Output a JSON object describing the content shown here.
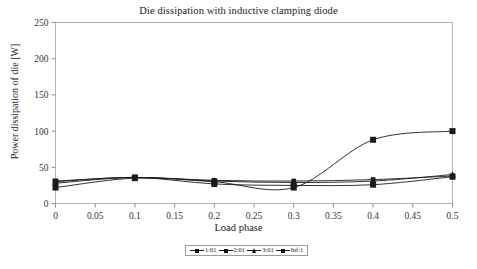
{
  "chart_data": {
    "type": "line",
    "title": "Die dissipation with inductive clamping diode",
    "xlabel": "Load phase",
    "ylabel": "Power dissipation of die [W]",
    "xlim": [
      0,
      0.5
    ],
    "ylim": [
      0,
      250
    ],
    "grid": false,
    "legend_position": "bottom",
    "xticks": [
      "0",
      "0.05",
      "0.1",
      "0.15",
      "0.2",
      "0.25",
      "0.3",
      "0.35",
      "0.4",
      "0.45",
      "0.5"
    ],
    "xtick_values": [
      0,
      0.05,
      0.1,
      0.15,
      0.2,
      0.25,
      0.3,
      0.35,
      0.4,
      0.45,
      0.5
    ],
    "yticks": [
      "0",
      "50",
      "100",
      "150",
      "200",
      "250"
    ],
    "ytick_values": [
      0,
      50,
      100,
      150,
      200,
      250
    ],
    "x": [
      0,
      0.1,
      0.2,
      0.3,
      0.4,
      0.5
    ],
    "series": [
      {
        "name": "1:01",
        "marker": "square-small",
        "color": "#1b1b1b",
        "values": [
          31,
          36,
          32,
          31,
          33,
          38
        ]
      },
      {
        "name": "2:01",
        "marker": "square",
        "color": "#1b1b1b",
        "values": [
          30,
          36,
          27,
          25,
          26,
          37
        ]
      },
      {
        "name": "3:01",
        "marker": "triangle",
        "color": "#1b1b1b",
        "values": [
          28,
          36,
          31,
          29,
          31,
          40
        ]
      },
      {
        "name": "Inf:1",
        "marker": "square",
        "color": "#1b1b1b",
        "values": [
          22,
          35,
          30,
          22,
          88,
          100
        ]
      }
    ]
  },
  "axes": {
    "ytick_labels": [
      "250",
      "200",
      "150",
      "100",
      "50",
      "0"
    ],
    "xtick_labels": [
      "0",
      "0.05",
      "0.1",
      "0.15",
      "0.2",
      "0.25",
      "0.3",
      "0.35",
      "0.4",
      "0.45",
      "0.5"
    ]
  },
  "legend": {
    "entries": [
      {
        "label": "1:01"
      },
      {
        "label": "2:01"
      },
      {
        "label": "3:01"
      },
      {
        "label": "Inf:1"
      }
    ]
  }
}
